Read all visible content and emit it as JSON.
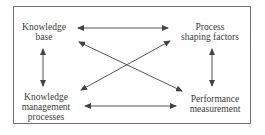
{
  "diagram": {
    "type": "bidirectional relationship diagram",
    "nodes": [
      {
        "id": "knowledge_base",
        "lines": [
          "Knowledge",
          "base"
        ],
        "position": "top-left"
      },
      {
        "id": "process_shaping_factors",
        "lines": [
          "Process",
          "shaping factors"
        ],
        "position": "top-right"
      },
      {
        "id": "knowledge_management_processes",
        "lines": [
          "Knowledge",
          "management",
          "processes"
        ],
        "position": "bottom-left"
      },
      {
        "id": "performance_measurement",
        "lines": [
          "Performance",
          "measurement"
        ],
        "position": "bottom-right"
      }
    ],
    "edges": [
      {
        "from": "knowledge_base",
        "to": "process_shaping_factors",
        "direction": "both"
      },
      {
        "from": "knowledge_base",
        "to": "knowledge_management_processes",
        "direction": "both"
      },
      {
        "from": "process_shaping_factors",
        "to": "performance_measurement",
        "direction": "both"
      },
      {
        "from": "knowledge_management_processes",
        "to": "performance_measurement",
        "direction": "both"
      },
      {
        "from": "knowledge_base",
        "to": "performance_measurement",
        "direction": "both"
      },
      {
        "from": "process_shaping_factors",
        "to": "knowledge_management_processes",
        "direction": "both"
      }
    ],
    "colors": {
      "line": "#555555",
      "text": "#3a3a3a",
      "frame": "#6e6e6e"
    }
  }
}
